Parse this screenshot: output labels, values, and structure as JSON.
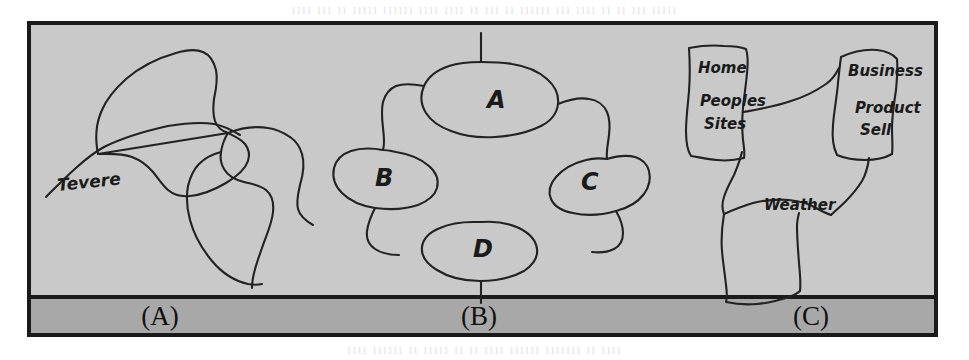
{
  "figure": {
    "panel_fill": "#c9c9c9",
    "caption_bar_fill": "#a8a8a8",
    "border_color": "#1a1a1a",
    "ink_color": "#222222",
    "frame": {
      "x": 28,
      "y": 22,
      "width": 909,
      "height": 314
    },
    "caption_bar": {
      "y": 296,
      "height": 40
    }
  },
  "bleed_through": {
    "top": "ıııı ııı ıı ııııı ıııııı ıııı ıııı ıı ııı ıı ıııııı ııı ıııı ıı ıı ııı ııııı",
    "bottom": "ıııı ıııııı ıı ııııı ıı ıı ıııı ıııııı ııııııı ıı ıııı"
  },
  "panels": [
    {
      "id": "a",
      "caption": "(A)",
      "caption_x": 160,
      "kind": "river-sketch",
      "labels": [
        {
          "text": "Tevere",
          "x": 58,
          "y": 191,
          "rotate": -6,
          "size": 17
        }
      ]
    },
    {
      "id": "b",
      "caption": "(B)",
      "caption_x": 479,
      "kind": "node-link-diagram",
      "labels": [
        {
          "text": "A",
          "x": 487,
          "y": 108,
          "rotate": 0,
          "size": 24
        },
        {
          "text": "B",
          "x": 375,
          "y": 186,
          "rotate": 0,
          "size": 24
        },
        {
          "text": "C",
          "x": 581,
          "y": 190,
          "rotate": 0,
          "size": 24
        },
        {
          "text": "D",
          "x": 473,
          "y": 257,
          "rotate": 0,
          "size": 24
        }
      ]
    },
    {
      "id": "c",
      "caption": "(C)",
      "caption_x": 811,
      "kind": "site-map-diagram",
      "labels": [
        {
          "text": "Home",
          "x": 698,
          "y": 73,
          "rotate": 0,
          "size": 15
        },
        {
          "text": "Peoples",
          "x": 700,
          "y": 106,
          "rotate": 0,
          "size": 15
        },
        {
          "text": "Sites",
          "x": 704,
          "y": 129,
          "rotate": 0,
          "size": 15
        },
        {
          "text": "Business",
          "x": 848,
          "y": 76,
          "rotate": 0,
          "size": 15
        },
        {
          "text": "Product",
          "x": 855,
          "y": 113,
          "rotate": 0,
          "size": 15
        },
        {
          "text": "Sell",
          "x": 860,
          "y": 135,
          "rotate": 0,
          "size": 15
        },
        {
          "text": "Weather",
          "x": 764,
          "y": 210,
          "rotate": 0,
          "size": 15
        }
      ]
    }
  ],
  "strokes": {
    "panel_a": [
      "M 46 197 C 62 181 84 158 104 147 C 126 136 150 130 168 126",
      "M 168 126 C 186 123 202 122 214 124 C 224 126 232 130 240 135",
      "M 98 154 C 95 139 96 123 102 110 C 107 98 116 88 126 79 C 140 67 158 58 176 53 C 186 50 196 49 203 52 C 210 55 214 62 216 70 C 218 80 216 90 214 99",
      "M 214 99 C 213 107 213 115 215 121 C 217 127 222 131 228 133",
      "M 228 133 C 234 136 241 139 245 144 C 249 149 250 155 248 161 C 245 170 236 177 226 183 C 214 190 201 195 190 196 C 181 197 174 195 168 190 C 162 185 158 178 153 172 C 147 165 140 160 132 157 C 121 153 108 154 98 154 Z",
      "M 228 133 C 241 128 256 126 268 128 C 277 129 284 133 290 137",
      "M 290 137 C 296 141 300 147 302 154 C 305 164 303 175 300 185",
      "M 300 185 C 298 194 296 202 298 209 C 300 216 306 221 313 225",
      "M 228 133 C 224 139 222 146 221 152",
      "M 221 152 C 220 158 221 164 224 169 C 228 176 236 180 244 182",
      "M 244 182 C 252 184 260 185 266 190 C 272 195 274 203 273 212 C 272 224 266 236 262 248 C 257 262 252 276 252 288",
      "M 221 152 C 213 154 205 158 199 164 C 193 170 190 178 188 186",
      "M 188 186 C 186 197 187 209 190 220 C 194 235 202 249 212 261 C 222 273 235 281 248 284 C 253 285 258 285 262 284"
    ],
    "panel_b": [
      "M 481 33 L 481 62",
      "M 481 62 C 470 62 458 63 449 66 C 437 70 428 77 424 86 C 420 95 421 105 426 113 C 431 121 440 127 451 131 C 464 136 480 138 495 137 C 512 136 529 132 541 126 C 551 121 557 113 558 104 C 559 95 555 86 547 79 C 538 71 525 66 512 64 C 502 62 491 62 481 62 Z",
      "M 424 86 C 414 84 404 83 396 86 C 389 89 385 95 383 102 C 381 110 382 119 383 128",
      "M 383 128 C 384 136 385 144 383 150",
      "M 558 104 C 568 100 579 97 589 99 C 597 100 604 105 607 112 C 610 119 610 127 609 135 C 608 144 606 152 607 159",
      "M 383 150 C 372 148 360 148 351 151 C 342 154 336 160 334 168 C 332 177 335 186 342 193 C 350 201 362 206 375 208 C 390 210 406 209 418 205 C 428 201 435 195 437 188 C 439 180 436 172 429 166 C 421 159 409 154 396 152 C 391 151 387 150 383 150 Z",
      "M 607 159 C 617 156 627 155 635 157 C 642 159 647 164 649 171 C 651 179 649 187 644 194 C 638 202 628 208 616 211 C 602 215 586 216 573 213 C 562 211 554 206 551 199 C 548 192 550 184 556 177 C 563 169 574 163 586 160 C 593 158 600 158 607 159 Z",
      "M 375 208 C 371 216 368 224 367 231 C 366 239 369 245 375 249 C 381 253 390 255 399 255",
      "M 616 211 C 620 218 623 226 623 233 C 623 240 620 246 614 249 C 608 252 600 253 592 252",
      "M 473 222 C 461 222 449 224 440 228 C 430 232 423 239 422 247 C 421 256 427 264 437 270 C 448 277 464 281 480 281 C 497 281 513 277 524 271 C 533 265 538 257 537 249 C 536 240 529 233 519 228 C 508 223 495 221 482 222 C 479 222 476 222 473 222 Z",
      "M 481 281 L 481 303"
    ],
    "panel_c": [
      "M 689 48 C 700 46 713 45 724 46 C 733 46 741 47 746 49 C 748 55 748 64 747 73 C 746 85 744 97 743 108 C 742 119 742 130 743 140 C 744 147 745 153 744 158 C 736 160 726 161 717 160 C 707 159 698 157 691 156 C 687 150 686 141 686 131 C 686 118 688 104 689 91 C 690 78 690 64 689 48 Z",
      "M 841 57 C 852 52 865 49 877 50 C 886 51 893 54 897 59 C 898 68 897 79 896 90 C 894 103 892 116 892 128 C 892 138 893 147 892 154 C 885 158 875 160 865 160 C 854 160 844 158 837 155 C 833 147 832 136 833 125 C 834 111 837 96 838 83 C 839 73 840 64 841 57 Z",
      "M 744 112 C 760 109 777 106 791 101 C 804 97 816 91 826 84 C 832 80 836 74 839 68",
      "M 742 152 C 740 160 737 168 734 175 C 730 183 726 190 724 197 C 722 203 722 209 724 214",
      "M 869 158 C 868 166 866 174 862 181 C 857 189 851 196 845 202 C 840 207 835 211 831 215",
      "M 724 214 C 733 210 743 206 753 203 C 765 200 778 199 789 200 C 799 201 808 203 816 208 C 821 211 826 213 831 215",
      "M 724 214 C 722 226 721 239 722 251 C 723 263 725 275 726 285 C 727 292 727 298 726 302 C 735 304 746 305 757 304 C 769 303 780 300 789 297 C 794 295 798 293 800 291 C 801 283 800 273 799 263 C 798 250 797 237 797 226 C 797 221 798 217 799 213"
    ]
  }
}
